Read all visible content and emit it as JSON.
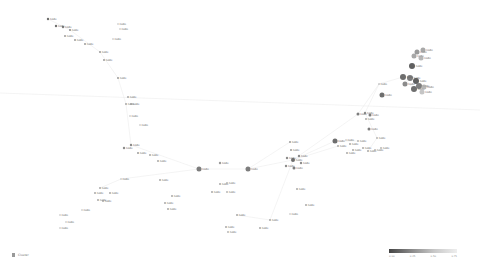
{
  "graph": {
    "edge_color": "#e2e2e2",
    "long_line": {
      "x1": 0,
      "y1": 93,
      "x2": 480,
      "y2": 110
    },
    "nodes": [
      {
        "x": 48,
        "y": 19,
        "r": 1.2,
        "fill": "#555",
        "label": "node"
      },
      {
        "x": 56,
        "y": 26,
        "r": 1.2,
        "fill": "#555",
        "label": "node"
      },
      {
        "x": 63,
        "y": 27,
        "r": 1.2,
        "fill": "#666",
        "label": "node"
      },
      {
        "x": 70,
        "y": 30,
        "r": 1,
        "fill": "#777",
        "label": "node"
      },
      {
        "x": 65,
        "y": 36,
        "r": 1,
        "fill": "#888",
        "label": "node"
      },
      {
        "x": 75,
        "y": 40,
        "r": 1,
        "fill": "#888",
        "label": "node"
      },
      {
        "x": 85,
        "y": 44,
        "r": 1,
        "fill": "#888",
        "label": "node"
      },
      {
        "x": 100,
        "y": 52,
        "r": 1,
        "fill": "#888",
        "label": "node"
      },
      {
        "x": 104,
        "y": 60,
        "r": 1,
        "fill": "#888",
        "label": "node"
      },
      {
        "x": 118,
        "y": 24,
        "r": 0.8,
        "fill": "#aaa",
        "label": "node"
      },
      {
        "x": 120,
        "y": 29,
        "r": 0.8,
        "fill": "#aaa",
        "label": "node"
      },
      {
        "x": 113,
        "y": 39,
        "r": 0.8,
        "fill": "#aaa",
        "label": "node"
      },
      {
        "x": 118,
        "y": 78,
        "r": 1,
        "fill": "#888",
        "label": "node"
      },
      {
        "x": 128,
        "y": 97,
        "r": 1,
        "fill": "#999",
        "label": "node"
      },
      {
        "x": 126,
        "y": 104,
        "r": 1,
        "fill": "#999",
        "label": "node"
      },
      {
        "x": 131,
        "y": 104,
        "r": 1,
        "fill": "#999",
        "label": "node"
      },
      {
        "x": 130,
        "y": 116,
        "r": 0.8,
        "fill": "#aaa",
        "label": "node"
      },
      {
        "x": 140,
        "y": 125,
        "r": 0.8,
        "fill": "#aaa",
        "label": "node"
      },
      {
        "x": 131,
        "y": 145,
        "r": 1.2,
        "fill": "#777",
        "label": "node"
      },
      {
        "x": 124,
        "y": 148,
        "r": 1.2,
        "fill": "#777",
        "label": "node"
      },
      {
        "x": 138,
        "y": 153,
        "r": 1,
        "fill": "#888",
        "label": "node"
      },
      {
        "x": 150,
        "y": 155,
        "r": 1,
        "fill": "#999",
        "label": "node"
      },
      {
        "x": 158,
        "y": 161,
        "r": 1,
        "fill": "#999",
        "label": "node"
      },
      {
        "x": 121,
        "y": 179,
        "r": 0.8,
        "fill": "#aaa",
        "label": "node"
      },
      {
        "x": 100,
        "y": 188,
        "r": 1,
        "fill": "#999",
        "label": "node"
      },
      {
        "x": 95,
        "y": 193,
        "r": 1,
        "fill": "#999",
        "label": "node"
      },
      {
        "x": 110,
        "y": 193,
        "r": 1,
        "fill": "#999",
        "label": "node"
      },
      {
        "x": 98,
        "y": 200,
        "r": 1,
        "fill": "#999",
        "label": "node"
      },
      {
        "x": 103,
        "y": 201,
        "r": 1,
        "fill": "#999",
        "label": "node"
      },
      {
        "x": 82,
        "y": 210,
        "r": 0.8,
        "fill": "#aaa",
        "label": "node"
      },
      {
        "x": 60,
        "y": 215,
        "r": 0.8,
        "fill": "#aaa",
        "label": "node"
      },
      {
        "x": 66,
        "y": 222,
        "r": 0.8,
        "fill": "#aaa",
        "label": "node"
      },
      {
        "x": 60,
        "y": 228,
        "r": 0.8,
        "fill": "#aaa",
        "label": "node"
      },
      {
        "x": 160,
        "y": 180,
        "r": 1,
        "fill": "#999",
        "label": "node"
      },
      {
        "x": 172,
        "y": 196,
        "r": 1,
        "fill": "#999",
        "label": "node"
      },
      {
        "x": 165,
        "y": 203,
        "r": 1,
        "fill": "#999",
        "label": "node"
      },
      {
        "x": 168,
        "y": 209,
        "r": 1,
        "fill": "#999",
        "label": "node"
      },
      {
        "x": 199,
        "y": 169,
        "r": 2.5,
        "fill": "#666",
        "label": "node"
      },
      {
        "x": 220,
        "y": 163,
        "r": 1.2,
        "fill": "#888",
        "label": "node"
      },
      {
        "x": 248,
        "y": 169,
        "r": 2.5,
        "fill": "#666",
        "label": "node"
      },
      {
        "x": 220,
        "y": 184,
        "r": 1,
        "fill": "#999",
        "label": "node"
      },
      {
        "x": 227,
        "y": 183,
        "r": 1,
        "fill": "#aaa",
        "label": "node"
      },
      {
        "x": 212,
        "y": 192,
        "r": 1,
        "fill": "#999",
        "label": "node"
      },
      {
        "x": 227,
        "y": 192,
        "r": 1,
        "fill": "#aaa",
        "label": "node"
      },
      {
        "x": 290,
        "y": 142,
        "r": 1,
        "fill": "#888",
        "label": "node"
      },
      {
        "x": 291,
        "y": 150,
        "r": 1,
        "fill": "#888",
        "label": "node"
      },
      {
        "x": 287,
        "y": 158,
        "r": 1.2,
        "fill": "#777",
        "label": "node"
      },
      {
        "x": 293,
        "y": 160,
        "r": 2,
        "fill": "#555",
        "label": "node"
      },
      {
        "x": 299,
        "y": 156,
        "r": 1.2,
        "fill": "#777",
        "label": "node"
      },
      {
        "x": 301,
        "y": 163,
        "r": 1.2,
        "fill": "#777",
        "label": "node"
      },
      {
        "x": 286,
        "y": 166,
        "r": 1.2,
        "fill": "#777",
        "label": "node"
      },
      {
        "x": 294,
        "y": 168,
        "r": 1.5,
        "fill": "#666",
        "label": "node"
      },
      {
        "x": 297,
        "y": 189,
        "r": 1,
        "fill": "#999",
        "label": "node"
      },
      {
        "x": 338,
        "y": 146,
        "r": 1,
        "fill": "#999",
        "label": "node"
      },
      {
        "x": 347,
        "y": 153,
        "r": 1,
        "fill": "#999",
        "label": "node"
      },
      {
        "x": 346,
        "y": 140,
        "r": 0.8,
        "fill": "#aaa",
        "label": "node"
      },
      {
        "x": 306,
        "y": 205,
        "r": 1,
        "fill": "#999",
        "label": "node"
      },
      {
        "x": 290,
        "y": 214,
        "r": 0.8,
        "fill": "#aaa",
        "label": "node"
      },
      {
        "x": 270,
        "y": 220,
        "r": 1,
        "fill": "#999",
        "label": "node"
      },
      {
        "x": 260,
        "y": 228,
        "r": 1,
        "fill": "#999",
        "label": "node"
      },
      {
        "x": 237,
        "y": 215,
        "r": 1,
        "fill": "#999",
        "label": "node"
      },
      {
        "x": 226,
        "y": 227,
        "r": 1,
        "fill": "#999",
        "label": "node"
      },
      {
        "x": 228,
        "y": 232,
        "r": 1,
        "fill": "#aaa",
        "label": "node"
      },
      {
        "x": 335,
        "y": 141,
        "r": 2.5,
        "fill": "#555",
        "label": "node"
      },
      {
        "x": 358,
        "y": 114,
        "r": 1.5,
        "fill": "#666",
        "label": "node"
      },
      {
        "x": 365,
        "y": 113,
        "r": 1.2,
        "fill": "#777",
        "label": "node"
      },
      {
        "x": 370,
        "y": 115,
        "r": 1.5,
        "fill": "#666",
        "label": "node"
      },
      {
        "x": 366,
        "y": 119,
        "r": 1,
        "fill": "#999",
        "label": "node"
      },
      {
        "x": 369,
        "y": 129,
        "r": 1.5,
        "fill": "#666",
        "label": "node"
      },
      {
        "x": 377,
        "y": 138,
        "r": 1,
        "fill": "#aaa",
        "label": "node"
      },
      {
        "x": 358,
        "y": 141,
        "r": 1,
        "fill": "#aaa",
        "label": "node"
      },
      {
        "x": 363,
        "y": 148,
        "r": 1,
        "fill": "#999",
        "label": "node"
      },
      {
        "x": 350,
        "y": 144,
        "r": 1,
        "fill": "#999",
        "label": "node"
      },
      {
        "x": 353,
        "y": 150,
        "r": 1,
        "fill": "#999",
        "label": "node"
      },
      {
        "x": 368,
        "y": 151,
        "r": 1,
        "fill": "#999",
        "label": "node"
      },
      {
        "x": 375,
        "y": 150,
        "r": 1,
        "fill": "#aaa",
        "label": "node"
      },
      {
        "x": 381,
        "y": 148,
        "r": 1,
        "fill": "#aaa",
        "label": "node"
      },
      {
        "x": 382,
        "y": 95,
        "r": 2.5,
        "fill": "#555",
        "label": "node"
      },
      {
        "x": 379,
        "y": 84,
        "r": 0.8,
        "fill": "#999",
        "label": "node"
      },
      {
        "x": 417,
        "y": 52,
        "r": 2.5,
        "fill": "#888",
        "label": "node"
      },
      {
        "x": 423,
        "y": 50,
        "r": 2.5,
        "fill": "#999",
        "label": "node"
      },
      {
        "x": 414,
        "y": 56,
        "r": 2.5,
        "fill": "#999",
        "label": "node"
      },
      {
        "x": 421,
        "y": 58,
        "r": 2.5,
        "fill": "#aaa",
        "label": "node"
      },
      {
        "x": 412,
        "y": 66,
        "r": 3,
        "fill": "#444",
        "label": "node"
      },
      {
        "x": 403,
        "y": 77,
        "r": 3,
        "fill": "#555",
        "label": "node"
      },
      {
        "x": 410,
        "y": 78,
        "r": 3,
        "fill": "#666",
        "label": "node"
      },
      {
        "x": 405,
        "y": 84,
        "r": 2.5,
        "fill": "#777",
        "label": "node"
      },
      {
        "x": 416,
        "y": 81,
        "r": 3,
        "fill": "#444",
        "label": "node"
      },
      {
        "x": 414,
        "y": 89,
        "r": 3,
        "fill": "#555",
        "label": "node"
      },
      {
        "x": 419,
        "y": 86,
        "r": 3,
        "fill": "#666",
        "label": "node"
      },
      {
        "x": 424,
        "y": 87,
        "r": 2.5,
        "fill": "#aaa",
        "label": "node"
      },
      {
        "x": 422,
        "y": 92,
        "r": 2.5,
        "fill": "#bbb",
        "label": "node"
      }
    ],
    "edges": [
      [
        37,
        39
      ],
      [
        39,
        47
      ],
      [
        47,
        64
      ],
      [
        64,
        78
      ],
      [
        78,
        84
      ],
      [
        47,
        53
      ],
      [
        47,
        63
      ],
      [
        63,
        70
      ],
      [
        39,
        44
      ],
      [
        37,
        18
      ],
      [
        18,
        14
      ],
      [
        14,
        12
      ],
      [
        12,
        7
      ],
      [
        7,
        3
      ],
      [
        3,
        0
      ],
      [
        37,
        23
      ],
      [
        23,
        24
      ],
      [
        47,
        58
      ],
      [
        58,
        60
      ],
      [
        78,
        65
      ],
      [
        84,
        88
      ],
      [
        65,
        69
      ],
      [
        69,
        74
      ]
    ]
  },
  "legend": {
    "icon": "legend-swatch-icon",
    "label": "Cluster"
  },
  "color_scale": {
    "ticks": [
      "0.00",
      "0.25",
      "0.50",
      "0.75"
    ]
  }
}
